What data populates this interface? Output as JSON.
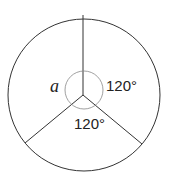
{
  "diagram": {
    "type": "circle-divided-into-three-sectors",
    "labels": {
      "unknown_angle": "a",
      "right_angle": "120°",
      "bottom_angle": "120°"
    },
    "colors": {
      "stroke": "#333333",
      "angle_arc": "#888888",
      "background": "#ffffff"
    }
  }
}
